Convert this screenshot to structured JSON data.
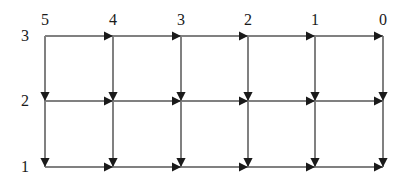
{
  "diagram": {
    "type": "directed-lattice-grid",
    "title": "",
    "background_color": "#ffffff",
    "line_color": "#808080",
    "arrow_color": "#1a1a1a",
    "label_color": "#1a1a1a",
    "columns": {
      "count": 6,
      "labels": [
        "5",
        "4",
        "3",
        "2",
        "1",
        "0"
      ],
      "x_positions": [
        45,
        113,
        181,
        248,
        315,
        383
      ],
      "label_y": 20
    },
    "rows": {
      "count": 3,
      "labels": [
        "3",
        "2",
        "1"
      ],
      "y_positions": [
        36,
        101,
        167
      ],
      "label_x": 25
    },
    "edges": {
      "horizontal_direction": "left-to-right",
      "vertical_direction": "top-to-bottom",
      "horizontal_count": 15,
      "vertical_count": 12,
      "arrowhead_position": "at-destination-node"
    },
    "nodes": [
      {
        "row": "3",
        "col": "5",
        "x": 45,
        "y": 36
      },
      {
        "row": "3",
        "col": "4",
        "x": 113,
        "y": 36
      },
      {
        "row": "3",
        "col": "3",
        "x": 181,
        "y": 36
      },
      {
        "row": "3",
        "col": "2",
        "x": 248,
        "y": 36
      },
      {
        "row": "3",
        "col": "1",
        "x": 315,
        "y": 36
      },
      {
        "row": "3",
        "col": "0",
        "x": 383,
        "y": 36
      },
      {
        "row": "2",
        "col": "5",
        "x": 45,
        "y": 101
      },
      {
        "row": "2",
        "col": "4",
        "x": 113,
        "y": 101
      },
      {
        "row": "2",
        "col": "3",
        "x": 181,
        "y": 101
      },
      {
        "row": "2",
        "col": "2",
        "x": 248,
        "y": 101
      },
      {
        "row": "2",
        "col": "1",
        "x": 315,
        "y": 101
      },
      {
        "row": "2",
        "col": "0",
        "x": 383,
        "y": 101
      },
      {
        "row": "1",
        "col": "5",
        "x": 45,
        "y": 167
      },
      {
        "row": "1",
        "col": "4",
        "x": 113,
        "y": 167
      },
      {
        "row": "1",
        "col": "3",
        "x": 181,
        "y": 167
      },
      {
        "row": "1",
        "col": "2",
        "x": 248,
        "y": 167
      },
      {
        "row": "1",
        "col": "1",
        "x": 315,
        "y": 167
      },
      {
        "row": "1",
        "col": "0",
        "x": 383,
        "y": 167
      }
    ]
  }
}
